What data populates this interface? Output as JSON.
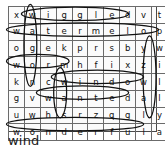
{
  "puzzle": {
    "type": "word-search",
    "rows": 8,
    "cols": 10,
    "grid": [
      [
        "x",
        "w",
        "i",
        "g",
        "g",
        "l",
        "e",
        "d",
        "v",
        "t"
      ],
      [
        "w",
        "a",
        "t",
        "e",
        "r",
        "m",
        "e",
        "l",
        "o",
        "p"
      ],
      [
        "o",
        "g",
        "e",
        "k",
        "p",
        "r",
        "s",
        "b",
        "y",
        "w"
      ],
      [
        "w",
        "o",
        "r",
        "m",
        "h",
        "f",
        "i",
        "x",
        "z",
        "i"
      ],
      [
        "k",
        "n",
        "c",
        "w",
        "i",
        "n",
        "d",
        "o",
        "w",
        "l"
      ],
      [
        "g",
        "v",
        "w",
        "a",
        "n",
        "t",
        "e",
        "d",
        "a",
        "l"
      ],
      [
        "u",
        "w",
        "h",
        "s",
        "r",
        "z",
        "q",
        "g",
        "l",
        "y"
      ],
      [
        "w",
        "o",
        "n",
        "d",
        "e",
        "r",
        "f",
        "u",
        "l",
        "a"
      ]
    ],
    "circled_words": [
      {
        "word": "wiggled",
        "direction": "horizontal",
        "row": 0,
        "start_col": 1,
        "end_col": 7
      },
      {
        "word": "watermelop",
        "direction": "horizontal",
        "row": 1,
        "start_col": 0,
        "end_col": 9
      },
      {
        "word": "worm",
        "direction": "horizontal",
        "row": 3,
        "start_col": 0,
        "end_col": 3
      },
      {
        "word": "window",
        "direction": "horizontal",
        "row": 4,
        "start_col": 3,
        "end_col": 8
      },
      {
        "word": "wanted",
        "direction": "horizontal",
        "row": 5,
        "start_col": 2,
        "end_col": 7
      },
      {
        "word": "wonderful",
        "direction": "horizontal",
        "row": 7,
        "start_col": 0,
        "end_col": 8
      },
      {
        "word": "wagon",
        "direction": "vertical",
        "col": 1,
        "start_row": 0,
        "end_row": 4
      },
      {
        "word": "was",
        "direction": "vertical",
        "col": 3,
        "start_row": 4,
        "end_row": 6
      },
      {
        "word": "willy",
        "direction": "vertical",
        "col": 9,
        "start_row": 2,
        "end_row": 6
      }
    ]
  },
  "caption": {
    "text": "wind"
  },
  "colors": {
    "grid_line": "#6b6b6b",
    "frame": "#4a4a4a",
    "letter": "#111111",
    "mark": "#111111",
    "background": "#ffffff"
  }
}
